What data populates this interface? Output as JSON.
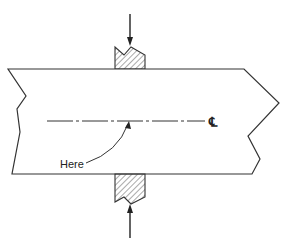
{
  "diagram": {
    "type": "engineering-sketch",
    "labels": {
      "pointer_label": "Here",
      "centerline_symbol": "℄"
    },
    "elements": [
      "top-force-arrow",
      "top-jaw-hatched",
      "plate-broken-section",
      "centerline-dash-dot",
      "centerline-symbol",
      "here-leader-arrow",
      "bottom-jaw-hatched",
      "bottom-force-arrow"
    ],
    "colors": {
      "line": "#333333",
      "background": "#ffffff"
    }
  }
}
